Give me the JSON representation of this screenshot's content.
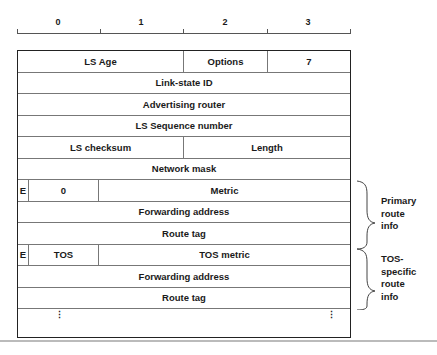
{
  "ruler": {
    "labels": [
      "0",
      "1",
      "2",
      "3"
    ]
  },
  "rows": [
    {
      "cells": [
        {
          "label": "LS Age",
          "span": 2
        },
        {
          "label": "Options",
          "span": 1
        },
        {
          "label": "7",
          "span": 1
        }
      ]
    },
    {
      "cells": [
        {
          "label": "Link-state ID",
          "span": 4
        }
      ]
    },
    {
      "cells": [
        {
          "label": "Advertising router",
          "span": 4
        }
      ]
    },
    {
      "cells": [
        {
          "label": "LS Sequence number",
          "span": 4
        }
      ]
    },
    {
      "cells": [
        {
          "label": "LS checksum",
          "span": 2
        },
        {
          "label": "Length",
          "span": 2
        }
      ]
    },
    {
      "cells": [
        {
          "label": "Network mask",
          "span": 4
        }
      ]
    },
    {
      "cells": [
        {
          "label": "E"
        },
        {
          "label": "0"
        },
        {
          "label": "Metric"
        }
      ]
    },
    {
      "cells": [
        {
          "label": "Forwarding address",
          "span": 4
        }
      ]
    },
    {
      "cells": [
        {
          "label": "Route tag",
          "span": 4
        }
      ]
    },
    {
      "cells": [
        {
          "label": "E"
        },
        {
          "label": "TOS"
        },
        {
          "label": "TOS metric"
        }
      ]
    },
    {
      "cells": [
        {
          "label": "Forwarding address",
          "span": 4
        }
      ]
    },
    {
      "cells": [
        {
          "label": "Route tag",
          "span": 4
        }
      ]
    }
  ],
  "continuation": {
    "left": "⋮",
    "right": "⋮"
  },
  "annotations": {
    "primary": {
      "line1": "Primary",
      "line2": "route",
      "line3": "info"
    },
    "tos": {
      "line1": "TOS-",
      "line2": "specific",
      "line3": "route",
      "line4": "info"
    }
  }
}
